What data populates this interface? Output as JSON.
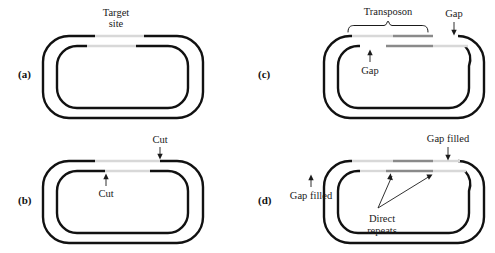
{
  "figure": {
    "background_color": "#ffffff",
    "dna_dark_color": "#111111",
    "dna_light_color": "#d8d8d8",
    "dna_mid_color": "#8a8a8a"
  },
  "panels": [
    {
      "id": "a",
      "label": "(a)",
      "annotations": [
        {
          "name": "target-site",
          "line1": "Target",
          "line2": "site",
          "pointer": "none"
        }
      ]
    },
    {
      "id": "b",
      "label": "(b)",
      "annotations": [
        {
          "name": "cut-top",
          "line1": "Cut",
          "line2": "",
          "pointer": "down-arrow"
        },
        {
          "name": "cut-bottom",
          "line1": "Cut",
          "line2": "",
          "pointer": "up-arrow"
        }
      ]
    },
    {
      "id": "c",
      "label": "(c)",
      "annotations": [
        {
          "name": "transposon",
          "line1": "Transposon",
          "line2": "",
          "pointer": "brace"
        },
        {
          "name": "gap-right",
          "line1": "Gap",
          "line2": "",
          "pointer": "down-arrow"
        },
        {
          "name": "gap-left",
          "line1": "Gap",
          "line2": "",
          "pointer": "up-arrow"
        }
      ]
    },
    {
      "id": "d",
      "label": "(d)",
      "annotations": [
        {
          "name": "gap-filled-right",
          "line1": "Gap filled",
          "line2": "",
          "pointer": "down-arrow"
        },
        {
          "name": "gap-filled-left",
          "line1": "Gap filled",
          "line2": "",
          "pointer": "up-arrow"
        },
        {
          "name": "direct-repeats",
          "line1": "Direct",
          "line2": "repeats",
          "pointer": "v-arrows"
        }
      ]
    }
  ],
  "labels": {
    "panel_a": "(a)",
    "panel_b": "(b)",
    "panel_c": "(c)",
    "panel_d": "(d)",
    "target_site_1": "Target",
    "target_site_2": "site",
    "cut_top": "Cut",
    "cut_bottom": "Cut",
    "transposon": "Transposon",
    "gap_right": "Gap",
    "gap_left": "Gap",
    "gap_filled_right": "Gap filled",
    "gap_filled_left": "Gap filled",
    "direct_repeats_1": "Direct",
    "direct_repeats_2": "repeats"
  }
}
